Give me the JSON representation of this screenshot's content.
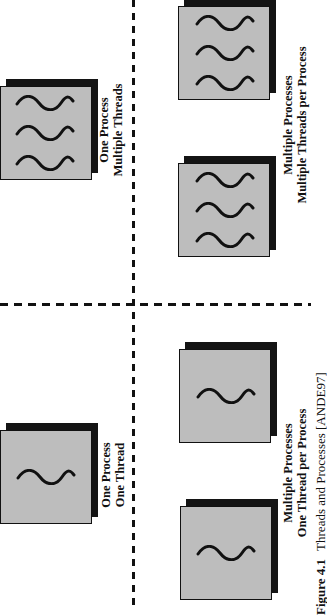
{
  "figure": {
    "orientation": "rotated 90 degrees counter-clockwise",
    "caption_number": "Figure 4.1",
    "caption_text": "Threads and Processes [ANDE97]",
    "colors": {
      "process_fill": "#bdbdbd",
      "process_shadow": "#141414",
      "thread_stroke": "#111111",
      "divider": "#111111"
    },
    "quadrants": [
      {
        "id": "one-process-one-thread",
        "label_line1": "One Process",
        "label_line2": "One Thread",
        "processes": 1,
        "threads_per_process": 1
      },
      {
        "id": "one-process-multiple-threads",
        "label_line1": "One Process",
        "label_line2": "Multiple Threads",
        "processes": 1,
        "threads_per_process": 3
      },
      {
        "id": "multiple-processes-one-thread",
        "label_line1": "Multiple Processes",
        "label_line2": "One Thread per Process",
        "processes": 2,
        "threads_per_process": 1
      },
      {
        "id": "multiple-processes-multiple-threads",
        "label_line1": "Multiple Processes",
        "label_line2": "Multiple Threads per Process",
        "processes": 2,
        "threads_per_process": 3
      }
    ],
    "icons": {
      "process": "process-box-icon",
      "thread": "thread-wave-icon"
    }
  }
}
